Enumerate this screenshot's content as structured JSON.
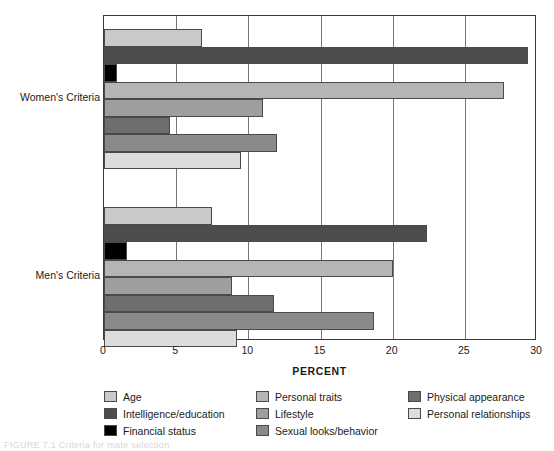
{
  "chart_data": {
    "type": "bar",
    "orientation": "horizontal",
    "title": "",
    "xlabel": "PERCENT",
    "ylabel": "",
    "xlim": [
      0,
      30
    ],
    "xticks": [
      0,
      5,
      10,
      15,
      20,
      25,
      30
    ],
    "xtick_labels": [
      "0",
      "5",
      "10",
      "15",
      "20",
      "25",
      "30"
    ],
    "grid": true,
    "grid_axis": "x",
    "legend_position": "below",
    "categories": [
      "Women's Criteria",
      "Men's Criteria"
    ],
    "series": [
      {
        "name": "Age",
        "color": "#c9c9c9",
        "values": [
          6.8,
          7.5
        ]
      },
      {
        "name": "Intelligence/education",
        "color": "#4d4d4d",
        "values": [
          29.4,
          22.4
        ]
      },
      {
        "name": "Financial status",
        "color": "#000000",
        "values": [
          0.9,
          1.6
        ]
      },
      {
        "name": "Personal traits",
        "color": "#b5b5b5",
        "values": [
          27.7,
          20.0
        ]
      },
      {
        "name": "Lifestyle",
        "color": "#9e9e9e",
        "values": [
          11.0,
          8.9
        ]
      },
      {
        "name": "Physical appearance",
        "color": "#6e6e6e",
        "values": [
          4.6,
          11.8
        ]
      },
      {
        "name": "Sexual looks/behavior",
        "color": "#8a8a8a",
        "values": [
          12.0,
          18.7
        ]
      },
      {
        "name": "Personal relationships",
        "color": "#dcdcdc",
        "values": [
          9.5,
          9.2
        ]
      }
    ]
  },
  "axis": {
    "x_title": "PERCENT",
    "ticks": [
      "0",
      "5",
      "10",
      "15",
      "20",
      "25",
      "30"
    ]
  },
  "group_labels": [
    "Women's Criteria",
    "Men's Criteria"
  ],
  "legend": {
    "items": [
      {
        "label": "Age",
        "color": "#c9c9c9"
      },
      {
        "label": "Intelligence/education",
        "color": "#4d4d4d"
      },
      {
        "label": "Financial status",
        "color": "#000000"
      },
      {
        "label": "Personal traits",
        "color": "#b5b5b5"
      },
      {
        "label": "Lifestyle",
        "color": "#9e9e9e"
      },
      {
        "label": "Sexual looks/behavior",
        "color": "#8a8a8a"
      },
      {
        "label": "Physical appearance",
        "color": "#6e6e6e"
      },
      {
        "label": "Personal relationships",
        "color": "#dcdcdc"
      }
    ],
    "column_order": [
      [
        "Age",
        "Intelligence/education",
        "Financial status"
      ],
      [
        "Personal traits",
        "Lifestyle",
        "Sexual looks/behavior"
      ],
      [
        "Physical appearance",
        "Personal relationships",
        ""
      ]
    ]
  },
  "caption": "FIGURE 7.1  Criteria for mate selection"
}
